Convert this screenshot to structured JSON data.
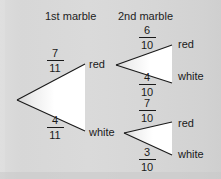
{
  "diagram": {
    "type": "probability-tree",
    "background_color": "#d6d6d6",
    "line_color": "#1a1a1a",
    "text_color": "#1a1a1a",
    "headers": [
      {
        "id": "stage1",
        "label": "1st marble"
      },
      {
        "id": "stage2",
        "label": "2nd marble"
      }
    ],
    "stage1": {
      "branches": [
        {
          "id": "s1-red",
          "outcome": "red",
          "numerator": "7",
          "denominator": "11"
        },
        {
          "id": "s1-white",
          "outcome": "white",
          "numerator": "4",
          "denominator": "11"
        }
      ]
    },
    "stage2_from_red": {
      "parent": "red",
      "branches": [
        {
          "id": "s2-red-red",
          "outcome": "red",
          "numerator": "6",
          "denominator": "10"
        },
        {
          "id": "s2-red-white",
          "outcome": "white",
          "numerator": "4",
          "denominator": "10"
        }
      ]
    },
    "stage2_from_white": {
      "parent": "white",
      "branches": [
        {
          "id": "s2-white-red",
          "outcome": "red",
          "numerator": "7",
          "denominator": "10"
        },
        {
          "id": "s2-white-white",
          "outcome": "white",
          "numerator": "3",
          "denominator": "10"
        }
      ]
    },
    "nodes": {
      "red_label": "red",
      "white_label": "white"
    },
    "leaves": [
      {
        "id": "leaf-rr",
        "label": "red"
      },
      {
        "id": "leaf-rw",
        "label": "white"
      },
      {
        "id": "leaf-wr",
        "label": "red"
      },
      {
        "id": "leaf-ww",
        "label": "white"
      }
    ]
  }
}
